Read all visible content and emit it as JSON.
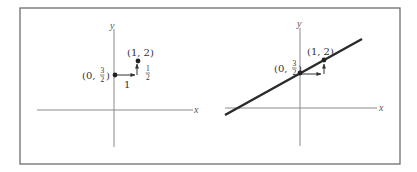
{
  "figure": {
    "panels": [
      {
        "id": "left",
        "axes": {
          "x_label": "x",
          "y_label": "y"
        },
        "points": [
          {
            "label_prefix": "(0, ",
            "label_num": "3",
            "label_den": "2",
            "label_suffix": ")"
          },
          {
            "label": "(1, 2)"
          }
        ],
        "run_label": "1",
        "rise_num": "1",
        "rise_den": "2",
        "line_drawn": false
      },
      {
        "id": "right",
        "axes": {
          "x_label": "x",
          "y_label": "y"
        },
        "points": [
          {
            "label_prefix": "(0, ",
            "label_num": "3",
            "label_den": "2",
            "label_suffix": ")"
          },
          {
            "label": "(1, 2)"
          }
        ],
        "line_drawn": true
      }
    ],
    "colors": {
      "frame": "#6e6e6e",
      "axis": "#8a8a8a",
      "ink": "#222222"
    }
  }
}
